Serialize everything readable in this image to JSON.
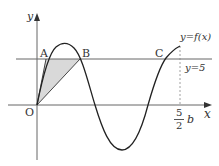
{
  "diagram": {
    "axes": {
      "x_label": "x",
      "y_label": "y",
      "origin_label": "O"
    },
    "points": {
      "A": "A",
      "B": "B",
      "C": "C"
    },
    "curve_label": "y=f(x)",
    "line_label": "y=5",
    "tick": {
      "numerator": "5",
      "denominator": "2",
      "variable": "b"
    },
    "colors": {
      "curve": "#222222",
      "axis": "#555555",
      "shade": "#d8d8d8",
      "dashed": "#888888"
    }
  }
}
